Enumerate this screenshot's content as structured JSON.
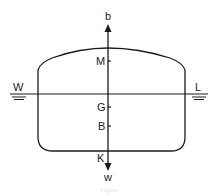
{
  "diagram": {
    "type": "ship stability cross-section",
    "labels": {
      "top_arrow": "b",
      "bottom_arrow": "w",
      "waterline_left": "W",
      "waterline_right": "L",
      "metacenter": "M",
      "center_of_gravity": "G",
      "center_of_buoyancy": "B",
      "keel": "K"
    },
    "caption": "Figure",
    "colors": {
      "stroke": "#1a1a1a",
      "background": "#ffffff"
    }
  }
}
